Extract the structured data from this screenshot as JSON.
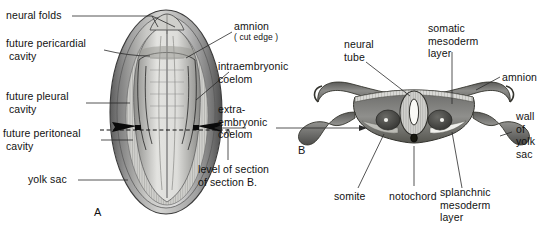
{
  "figure": {
    "panels": [
      {
        "id": "A",
        "letter": "A"
      },
      {
        "id": "B",
        "letter": "B"
      }
    ]
  },
  "labels_left": {
    "neural_folds": "neural folds",
    "future_pericardial": "future pericardial\n cavity",
    "future_pleural": "future pleural\n cavity",
    "future_peritoneal": "future peritoneal\n cavity",
    "yolk_sac": "yolk sac"
  },
  "labels_center": {
    "amnion_cut": "amnion",
    "amnion_cut_sub": "( cut edge )",
    "intraembryonic_coelom": "intraembryonic\ncoelom",
    "extraembryonic_coelom": "extra-\nembryonic\ncoelom",
    "level_of_section": "level of section\nof section B."
  },
  "labels_right": {
    "neural_tube": "neural\ntube",
    "somatic_mesoderm": "somatic\nmesoderm\nlayer",
    "amnion": "amnion",
    "wall_of_yolk_sac": "wall\nof\nyolk\nsac",
    "splanchnic_mesoderm": "splanchnic\nmesoderm\nlayer",
    "somite": "somite",
    "notochord": "notochord"
  },
  "colors": {
    "ink": "#121212",
    "leader": "#2a2a2a",
    "background": "#ffffff",
    "tissue_dark": "#4a4a4a",
    "tissue_mid": "#7d7d7d",
    "tissue_light": "#cfcfcf",
    "lumen": "#f4f4f2"
  }
}
